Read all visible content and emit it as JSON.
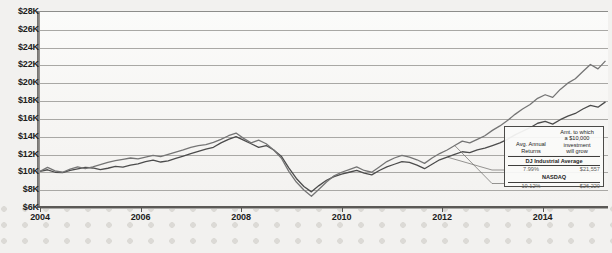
{
  "chart_data": {
    "type": "line",
    "title": "",
    "subtitle": "",
    "xlabel": "",
    "ylabel": "",
    "grid": true,
    "legend_position": "inset-bottom-right",
    "xlim": [
      2004,
      2015.3
    ],
    "ylim": [
      6000,
      28000
    ],
    "ytick_labels": [
      "$28K",
      "$26K",
      "$24K",
      "$22K",
      "$20K",
      "$18K",
      "$16K",
      "$14K",
      "$12K",
      "$10K",
      "$8K",
      "$6K"
    ],
    "ytick_values": [
      28000,
      26000,
      24000,
      22000,
      20000,
      18000,
      16000,
      14000,
      12000,
      10000,
      8000,
      6000
    ],
    "xtick_labels": [
      "2004",
      "2006",
      "2008",
      "2010",
      "2012",
      "2014"
    ],
    "xtick_values": [
      2004,
      2006,
      2008,
      2010,
      2012,
      2014
    ],
    "series": [
      {
        "name": "DJ Industrial Average",
        "color": "#4c4c4c",
        "x": [
          2004.0,
          2004.15,
          2004.3,
          2004.45,
          2004.6,
          2004.75,
          2004.9,
          2005.05,
          2005.2,
          2005.35,
          2005.5,
          2005.65,
          2005.8,
          2005.95,
          2006.1,
          2006.25,
          2006.4,
          2006.55,
          2006.7,
          2006.85,
          2007.0,
          2007.15,
          2007.3,
          2007.45,
          2007.6,
          2007.75,
          2007.9,
          2008.05,
          2008.2,
          2008.35,
          2008.5,
          2008.65,
          2008.8,
          2008.95,
          2009.1,
          2009.25,
          2009.4,
          2009.55,
          2009.7,
          2009.85,
          2010.0,
          2010.15,
          2010.3,
          2010.45,
          2010.6,
          2010.75,
          2010.9,
          2011.05,
          2011.2,
          2011.35,
          2011.5,
          2011.65,
          2011.8,
          2011.95,
          2012.1,
          2012.25,
          2012.4,
          2012.55,
          2012.7,
          2012.85,
          2013.0,
          2013.15,
          2013.3,
          2013.45,
          2013.6,
          2013.75,
          2013.9,
          2014.05,
          2014.2,
          2014.35,
          2014.5,
          2014.65,
          2014.8,
          2014.95,
          2015.1,
          2015.25
        ],
        "y": [
          10000,
          10180,
          9900,
          9850,
          10100,
          10280,
          10450,
          10380,
          10200,
          10350,
          10550,
          10480,
          10700,
          10850,
          11100,
          11250,
          11050,
          11180,
          11450,
          11700,
          12000,
          12250,
          12500,
          12700,
          13200,
          13600,
          13900,
          13500,
          13100,
          12700,
          12900,
          12400,
          11700,
          10400,
          9200,
          8300,
          7700,
          8400,
          9000,
          9400,
          9700,
          9900,
          10100,
          9800,
          9600,
          10100,
          10500,
          10800,
          11100,
          11000,
          10700,
          10300,
          10800,
          11300,
          11600,
          11900,
          12200,
          12100,
          12400,
          12600,
          12900,
          13200,
          13600,
          14100,
          14500,
          14900,
          15400,
          15600,
          15300,
          15800,
          16200,
          16500,
          17000,
          17400,
          17200,
          17800
        ],
        "dollar_scale_note": "values plotted are growth of a $10,000 investment"
      },
      {
        "name": "NASDAQ",
        "color": "#757575",
        "x": [
          2004.0,
          2004.15,
          2004.3,
          2004.45,
          2004.6,
          2004.75,
          2004.9,
          2005.05,
          2005.2,
          2005.35,
          2005.5,
          2005.65,
          2005.8,
          2005.95,
          2006.1,
          2006.25,
          2006.4,
          2006.55,
          2006.7,
          2006.85,
          2007.0,
          2007.15,
          2007.3,
          2007.45,
          2007.6,
          2007.75,
          2007.9,
          2008.05,
          2008.2,
          2008.35,
          2008.5,
          2008.65,
          2008.8,
          2008.95,
          2009.1,
          2009.25,
          2009.4,
          2009.55,
          2009.7,
          2009.85,
          2010.0,
          2010.15,
          2010.3,
          2010.45,
          2010.6,
          2010.75,
          2010.9,
          2011.05,
          2011.2,
          2011.35,
          2011.5,
          2011.65,
          2011.8,
          2011.95,
          2012.1,
          2012.25,
          2012.4,
          2012.55,
          2012.7,
          2012.85,
          2013.0,
          2013.15,
          2013.3,
          2013.45,
          2013.6,
          2013.75,
          2013.9,
          2014.05,
          2014.2,
          2014.35,
          2014.5,
          2014.65,
          2014.8,
          2014.95,
          2015.1,
          2015.25
        ],
        "y": [
          10000,
          10450,
          10050,
          9900,
          10250,
          10500,
          10300,
          10500,
          10750,
          11000,
          11200,
          11350,
          11500,
          11400,
          11600,
          11800,
          11650,
          11900,
          12150,
          12400,
          12700,
          12900,
          13000,
          13250,
          13600,
          14000,
          14300,
          13700,
          13200,
          13500,
          13100,
          12400,
          11500,
          10000,
          8800,
          7900,
          7200,
          8000,
          8800,
          9500,
          9900,
          10200,
          10500,
          10100,
          9900,
          10500,
          11100,
          11500,
          11800,
          11600,
          11300,
          10900,
          11500,
          12000,
          12400,
          12900,
          13400,
          13200,
          13600,
          14000,
          14600,
          15100,
          15700,
          16400,
          17000,
          17500,
          18200,
          18600,
          18300,
          19200,
          19900,
          20400,
          21200,
          22000,
          21500,
          22400
        ],
        "dollar_scale_note": "values plotted are growth of a $10,000 investment"
      }
    ],
    "annotations": [
      {
        "kind": "leader-line",
        "from_series": "DJ Industrial Average",
        "to_row": "DJ Industrial Average"
      },
      {
        "kind": "leader-line",
        "from_series": "NASDAQ",
        "to_row": "NASDAQ"
      }
    ]
  },
  "legend_table": {
    "col1_header": "Avg. Annual Returns",
    "col1_header_line1": "Avg. Annual",
    "col1_header_line2": "Returns",
    "col2_header": "Amt. to which a $10,000 investment will grow",
    "col2_header_line1": "Amt. to which",
    "col2_header_line2": "a $10,000",
    "col2_header_line3": "investment",
    "col2_header_line4": "will grow",
    "rows": [
      {
        "name": "DJ Industrial Average",
        "avg_annual_return": "7.99%",
        "amount": "$21,557"
      },
      {
        "name": "NASDAQ",
        "avg_annual_return": "10.12%",
        "amount": "$26,220"
      }
    ]
  },
  "colors": {
    "series_djia": "#4c4c4c",
    "series_nasdaq": "#757575",
    "gridline": "#a9a8a5",
    "axis": "#5b5956",
    "page_background": "#f2f1ef",
    "plot_background": "#f8f7f5"
  }
}
